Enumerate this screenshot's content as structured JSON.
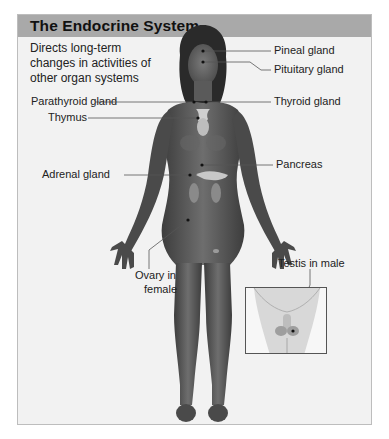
{
  "figure": {
    "title": "The Endocrine System",
    "description": "Directs long-term changes in activities of other organ systems",
    "description_lines": [
      "Directs long-term",
      "changes in activities of",
      "other organ systems"
    ],
    "labels": {
      "pineal": "Pineal gland",
      "pituitary": "Pituitary gland",
      "parathyroid": "Parathyroid gland",
      "thyroid": "Thyroid gland",
      "thymus": "Thymus",
      "pancreas": "Pancreas",
      "adrenal": "Adrenal gland",
      "ovary_line1": "Ovary in",
      "ovary_line2": "female",
      "testis": "Testis in male"
    },
    "colors": {
      "header_bg": "#a9a9a9",
      "panel_bg": "#f2f2f2",
      "skin": "#5e5e5e",
      "gland": "#c8c8c8"
    }
  }
}
